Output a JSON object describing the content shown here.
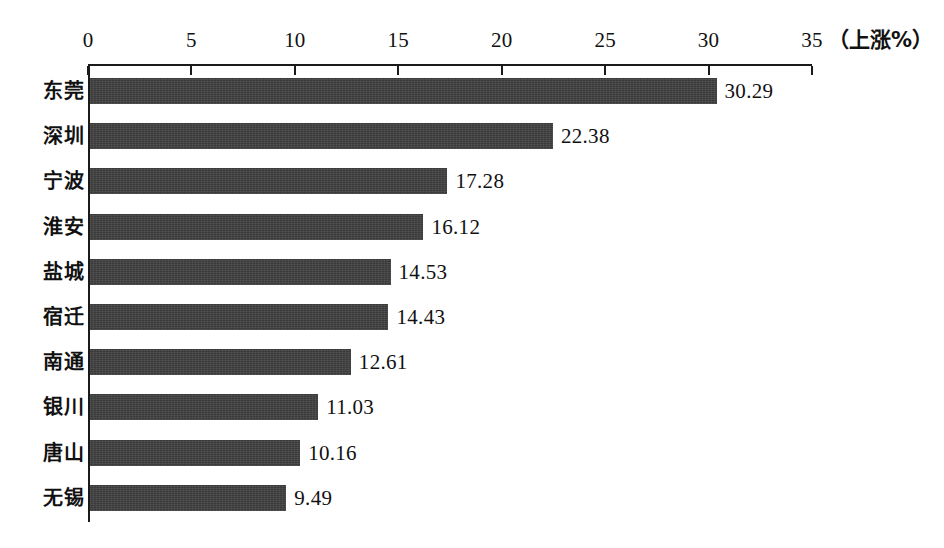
{
  "chart_data": {
    "type": "bar",
    "orientation": "horizontal",
    "title": "",
    "subtitle": "",
    "xlabel": "（上涨%）",
    "ylabel": "",
    "xlim": [
      0,
      35
    ],
    "ylim": null,
    "grid": false,
    "legend": null,
    "axis_position": "top",
    "xticks": [
      "0",
      "5",
      "10",
      "15",
      "20",
      "25",
      "30",
      "35"
    ],
    "xtick_values": [
      0,
      5,
      10,
      15,
      20,
      25,
      30,
      35
    ],
    "categories": [
      "东莞",
      "深圳",
      "宁波",
      "淮安",
      "盐城",
      "宿迁",
      "南通",
      "银川",
      "唐山",
      "无锡"
    ],
    "values": [
      30.29,
      22.38,
      17.28,
      16.12,
      14.53,
      14.43,
      12.61,
      11.03,
      10.16,
      9.49
    ],
    "value_labels": [
      "30.29",
      "22.38",
      "17.28",
      "16.12",
      "14.53",
      "14.43",
      "12.61",
      "11.03",
      "10.16",
      "9.49"
    ],
    "bars": [
      {
        "category": "东莞",
        "value": 30.29,
        "label": "30.29"
      },
      {
        "category": "深圳",
        "value": 22.38,
        "label": "22.38"
      },
      {
        "category": "宁波",
        "value": 17.28,
        "label": "17.28"
      },
      {
        "category": "淮安",
        "value": 16.12,
        "label": "16.12"
      },
      {
        "category": "盐城",
        "value": 14.53,
        "label": "14.53"
      },
      {
        "category": "宿迁",
        "value": 14.43,
        "label": "14.43"
      },
      {
        "category": "南通",
        "value": 12.61,
        "label": "12.61"
      },
      {
        "category": "银川",
        "value": 11.03,
        "label": "11.03"
      },
      {
        "category": "唐山",
        "value": 10.16,
        "label": "10.16"
      },
      {
        "category": "无锡",
        "value": 9.49,
        "label": "9.49"
      }
    ],
    "colors": {
      "bar": "#3a3a3a",
      "axis": "#1a1a1a",
      "text": "#111111",
      "background": "#ffffff"
    }
  }
}
